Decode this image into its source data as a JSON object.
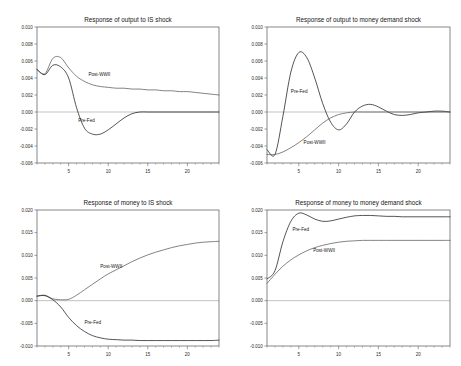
{
  "figure": {
    "background": "#ffffff",
    "panel_count": 4
  },
  "series_names": {
    "prefed": "Pre-Fed",
    "postwwii": "Post-WWII"
  },
  "colors": {
    "prefed": "#1c1c1c",
    "postwwii": "#5a5a5a",
    "frame": "#555555",
    "zeroline": "#9a9a9a"
  },
  "chart_data": [
    {
      "id": "output-is",
      "type": "line",
      "title": "Response of output to IS shock",
      "xlabel": "",
      "ylabel": "",
      "xlim": [
        1,
        24
      ],
      "ylim": [
        -0.006,
        0.01
      ],
      "xticks": [
        5,
        10,
        15,
        20
      ],
      "xtick_labels": [
        "5",
        "10",
        "15",
        "20"
      ],
      "yticks": [
        0.01,
        0.008,
        0.006,
        0.004,
        0.002,
        0.0,
        -0.002,
        -0.004,
        -0.006
      ],
      "ytick_labels": [
        "0.010",
        "0.008",
        "0.006",
        "0.004",
        "0.002",
        "0.000",
        "-0.002",
        "-0.004",
        "-0.006"
      ],
      "grid": false,
      "zero_reference": 0.0,
      "legend_position": "inline-annotation",
      "annotations": [
        {
          "text": "Post-WWII",
          "x": 7.5,
          "y": 0.0042
        },
        {
          "text": "Pre-Fed",
          "x": 6.2,
          "y": -0.0012
        }
      ],
      "x": [
        1,
        2,
        3,
        4,
        5,
        6,
        7,
        8,
        9,
        10,
        11,
        12,
        13,
        14,
        15,
        16,
        17,
        18,
        19,
        20,
        21,
        22,
        23,
        24
      ],
      "series": [
        {
          "name": "Post-WWII",
          "values": [
            0.005,
            0.0045,
            0.0063,
            0.0064,
            0.0052,
            0.0042,
            0.0036,
            0.0032,
            0.003,
            0.0029,
            0.0028,
            0.0028,
            0.0027,
            0.0027,
            0.0026,
            0.0026,
            0.0025,
            0.0025,
            0.0024,
            0.0024,
            0.0023,
            0.0022,
            0.0021,
            0.002
          ]
        },
        {
          "name": "Pre-Fed",
          "values": [
            0.005,
            0.0044,
            0.0055,
            0.0053,
            0.004,
            0.0005,
            -0.0019,
            -0.0026,
            -0.0026,
            -0.0021,
            -0.0014,
            -0.0007,
            -0.0002,
            0.0,
            0.0,
            0.0,
            0.0,
            0.0,
            0.0,
            0.0,
            0.0,
            0.0,
            0.0,
            0.0
          ]
        }
      ]
    },
    {
      "id": "output-money-demand",
      "type": "line",
      "title": "Response of output to money demand shock",
      "xlabel": "",
      "ylabel": "",
      "xlim": [
        1,
        24
      ],
      "ylim": [
        -0.006,
        0.01
      ],
      "xticks": [
        5,
        10,
        15,
        20
      ],
      "xtick_labels": [
        "5",
        "10",
        "15",
        "20"
      ],
      "yticks": [
        0.01,
        0.008,
        0.006,
        0.004,
        0.002,
        0.0,
        -0.002,
        -0.004,
        -0.006
      ],
      "ytick_labels": [
        "0.010",
        "0.008",
        "0.006",
        "0.004",
        "0.002",
        "0.000",
        "-0.002",
        "-0.004",
        "-0.006"
      ],
      "grid": false,
      "zero_reference": 0.0,
      "legend_position": "inline-annotation",
      "annotations": [
        {
          "text": "Pre-Fed",
          "x": 4.0,
          "y": 0.0022
        },
        {
          "text": "Post-WWII",
          "x": 5.6,
          "y": -0.0038
        }
      ],
      "x": [
        1,
        2,
        3,
        4,
        5,
        6,
        7,
        8,
        9,
        10,
        11,
        12,
        13,
        14,
        15,
        16,
        17,
        18,
        19,
        20,
        21,
        22,
        23,
        24
      ],
      "series": [
        {
          "name": "Pre-Fed",
          "values": [
            -0.0044,
            -0.005,
            -0.0005,
            0.0047,
            0.007,
            0.0064,
            0.004,
            0.001,
            -0.0012,
            -0.0021,
            -0.0014,
            0.0,
            0.0007,
            0.0009,
            0.0006,
            0.0001,
            -0.0003,
            -0.0004,
            -0.0003,
            -0.0001,
            0.0,
            0.0001,
            0.0001,
            0.0
          ]
        },
        {
          "name": "Post-WWII",
          "values": [
            -0.005,
            -0.005,
            -0.0047,
            -0.0042,
            -0.0036,
            -0.0029,
            -0.0021,
            -0.0013,
            -0.0007,
            -0.0003,
            -0.0001,
            0.0,
            0.0,
            0.0,
            0.0,
            0.0,
            0.0,
            0.0,
            0.0,
            0.0,
            0.0,
            0.0,
            0.0,
            0.0
          ]
        }
      ]
    },
    {
      "id": "money-is",
      "type": "line",
      "title": "Response of money to IS shock",
      "xlabel": "",
      "ylabel": "",
      "xlim": [
        1,
        24
      ],
      "ylim": [
        -0.01,
        0.02
      ],
      "xticks": [
        5,
        10,
        15,
        20
      ],
      "xtick_labels": [
        "5",
        "10",
        "15",
        "20"
      ],
      "yticks": [
        0.02,
        0.015,
        0.01,
        0.005,
        0.0,
        -0.005,
        -0.01
      ],
      "ytick_labels": [
        "0.020",
        "0.015",
        "0.010",
        "0.005",
        "0.000",
        "-0.005",
        "-0.010"
      ],
      "grid": false,
      "zero_reference": 0.0,
      "legend_position": "inline-annotation",
      "annotations": [
        {
          "text": "Post-WWII",
          "x": 9.0,
          "y": 0.0072
        },
        {
          "text": "Pre-Fed",
          "x": 7.0,
          "y": -0.0052
        }
      ],
      "x": [
        1,
        2,
        3,
        4,
        5,
        6,
        7,
        8,
        9,
        10,
        11,
        12,
        13,
        14,
        15,
        16,
        17,
        18,
        19,
        20,
        21,
        22,
        23,
        24
      ],
      "series": [
        {
          "name": "Post-WWII",
          "values": [
            0.001,
            0.0012,
            0.0004,
            0.0002,
            0.0003,
            0.0012,
            0.0024,
            0.0036,
            0.0048,
            0.0059,
            0.0068,
            0.0077,
            0.0086,
            0.0094,
            0.0101,
            0.0107,
            0.0112,
            0.0117,
            0.0121,
            0.0124,
            0.0127,
            0.0129,
            0.013,
            0.0131
          ]
        },
        {
          "name": "Pre-Fed",
          "values": [
            0.001,
            0.0011,
            0.0002,
            -0.0014,
            -0.0037,
            -0.0055,
            -0.0068,
            -0.0077,
            -0.0082,
            -0.0085,
            -0.0086,
            -0.0087,
            -0.0087,
            -0.0088,
            -0.0088,
            -0.0088,
            -0.0088,
            -0.0088,
            -0.0088,
            -0.0088,
            -0.0088,
            -0.0088,
            -0.0088,
            -0.0087
          ]
        }
      ]
    },
    {
      "id": "money-money-demand",
      "type": "line",
      "title": "Response of money to money demand shock",
      "xlabel": "",
      "ylabel": "",
      "xlim": [
        1,
        24
      ],
      "ylim": [
        -0.01,
        0.02
      ],
      "xticks": [
        5,
        10,
        15,
        20
      ],
      "xtick_labels": [
        "5",
        "10",
        "15",
        "20"
      ],
      "yticks": [
        0.02,
        0.015,
        0.01,
        0.005,
        0.0,
        -0.005,
        -0.01
      ],
      "ytick_labels": [
        "0.020",
        "0.015",
        "0.010",
        "0.005",
        "0.000",
        "-0.005",
        "-0.010"
      ],
      "grid": false,
      "zero_reference": 0.0,
      "legend_position": "inline-annotation",
      "annotations": [
        {
          "text": "Pre-Fed",
          "x": 4.2,
          "y": 0.0153
        },
        {
          "text": "Post-WWII",
          "x": 6.8,
          "y": 0.0107
        }
      ],
      "x": [
        1,
        2,
        3,
        4,
        5,
        6,
        7,
        8,
        9,
        10,
        11,
        12,
        13,
        14,
        15,
        16,
        17,
        18,
        19,
        20,
        21,
        22,
        23,
        24
      ],
      "series": [
        {
          "name": "Pre-Fed",
          "values": [
            0.0048,
            0.0066,
            0.013,
            0.0175,
            0.0193,
            0.0189,
            0.018,
            0.0175,
            0.0176,
            0.018,
            0.0184,
            0.0187,
            0.0188,
            0.0188,
            0.0187,
            0.0186,
            0.0186,
            0.0185,
            0.0185,
            0.0185,
            0.0185,
            0.0185,
            0.0185,
            0.0185
          ]
        },
        {
          "name": "Post-WWII",
          "values": [
            0.0038,
            0.0058,
            0.0076,
            0.009,
            0.0101,
            0.011,
            0.0117,
            0.0122,
            0.0126,
            0.0129,
            0.0131,
            0.0132,
            0.0133,
            0.0133,
            0.0133,
            0.0133,
            0.0133,
            0.0133,
            0.0133,
            0.0133,
            0.0133,
            0.0133,
            0.0133,
            0.0133
          ]
        }
      ]
    }
  ]
}
